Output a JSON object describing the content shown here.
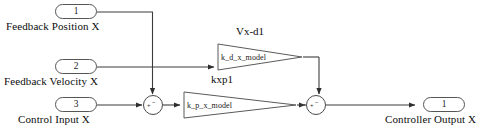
{
  "diagram": {
    "background_color": "#ffffff",
    "wire_color": "#404040",
    "block_border_color": "#555555"
  },
  "inputs": [
    {
      "number": "1",
      "label": "Feedback Position X"
    },
    {
      "number": "2",
      "label": "Feedback Velocity X"
    },
    {
      "number": "3",
      "label": "Control Input X"
    }
  ],
  "outputs": [
    {
      "number": "1",
      "label": "Controller Output X"
    }
  ],
  "gains": [
    {
      "name": "k_d_x_model",
      "annotation": "Vx-d1"
    },
    {
      "name": "k_p_x_model",
      "annotation": "kxp1"
    }
  ],
  "sums": [
    {
      "id": "sum-1",
      "left_sign": "+",
      "top_sign": "−"
    },
    {
      "id": "sum-2",
      "left_sign": "+",
      "top_sign": "−"
    }
  ]
}
